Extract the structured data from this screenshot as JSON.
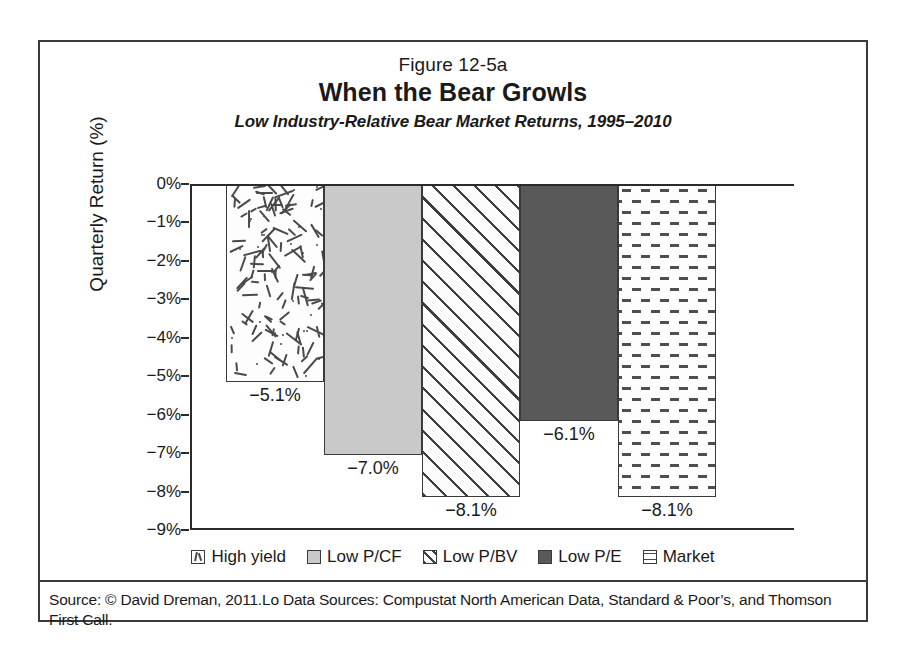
{
  "figure": {
    "number": "Figure 12-5a",
    "title": "When the Bear Growls",
    "subtitle": "Low Industry-Relative Bear Market Returns, 1995–2010",
    "source": "Source: © David Dreman, 2011.Lo Data Sources: Compustat North American Data, Standard & Poor’s, and Thomson First Call."
  },
  "chart_data": {
    "type": "bar",
    "title": "When the Bear Growls",
    "subtitle": "Low Industry-Relative Bear Market Returns, 1995–2010",
    "xlabel": "",
    "ylabel": "Quarterly Return (%)",
    "ylim": [
      -9,
      0
    ],
    "grid": false,
    "legend_position": "bottom",
    "ytick_labels": [
      "0%",
      "−1%",
      "−2%",
      "−3%",
      "−4%",
      "−5%",
      "−6%",
      "−7%",
      "−8%",
      "−9%"
    ],
    "ytick_values": [
      0,
      -1,
      -2,
      -3,
      -4,
      -5,
      -6,
      -7,
      -8,
      -9
    ],
    "categories": [
      "High yield",
      "Low P/CF",
      "Low P/BV",
      "Low P/E",
      "Market"
    ],
    "values": [
      -5.1,
      -7.0,
      -8.1,
      -6.1,
      -8.1
    ],
    "value_labels": [
      "−5.1%",
      "−7.0%",
      "−8.1%",
      "−6.1%",
      "−8.1%"
    ],
    "series": [
      {
        "name": "Low Industry-Relative Bear Market Returns",
        "values": [
          -5.1,
          -7.0,
          -8.1,
          -6.1,
          -8.1
        ]
      }
    ],
    "bar_styles": [
      "scattered-dashes",
      "solid-light-gray",
      "diagonal-hatch",
      "solid-dark-gray",
      "horizontal-dashes"
    ],
    "colors": {
      "axis": "#2b2b2b",
      "bar_outline": "#3a3a3a",
      "low_pcf_fill": "#c9c9c9",
      "low_pe_fill": "#595959",
      "pattern_ink": "#4a4a4a",
      "background": "#ffffff"
    }
  },
  "legend": {
    "items": [
      {
        "label": "High yield",
        "pattern": "scattered-dashes"
      },
      {
        "label": "Low P/CF",
        "pattern": "solid-light-gray"
      },
      {
        "label": "Low P/BV",
        "pattern": "diagonal-hatch"
      },
      {
        "label": "Low P/E",
        "pattern": "solid-dark-gray"
      },
      {
        "label": "Market",
        "pattern": "horizontal-dashes"
      }
    ]
  }
}
